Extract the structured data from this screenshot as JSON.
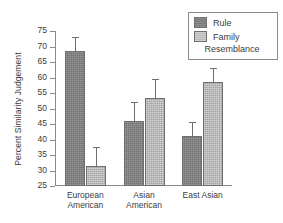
{
  "chart_data": {
    "type": "bar",
    "title": "",
    "xlabel": "",
    "ylabel": "Percent Similarity Judgement",
    "categories": [
      "European\nAmerican",
      "Asian\nAmerican",
      "East Asian"
    ],
    "ylim": [
      25,
      75
    ],
    "yticks": [
      75,
      70,
      65,
      60,
      55,
      50,
      45,
      40,
      35,
      30,
      25
    ],
    "grid": false,
    "legend_position": "top-right",
    "series": [
      {
        "name": "Rule",
        "color": "#7f7f7f",
        "values": [
          68.5,
          46.0,
          41.0
        ],
        "errors": [
          4.5,
          6.0,
          4.5
        ]
      },
      {
        "name": "Family Resemblance",
        "color": "#b7b7b7",
        "values": [
          31.5,
          53.5,
          58.5
        ],
        "errors": [
          6.0,
          6.0,
          4.5
        ]
      }
    ]
  },
  "legend": {
    "entries": [
      {
        "label": "Rule"
      },
      {
        "label": "Family"
      }
    ],
    "wrapped_second_line": "Resemblance"
  }
}
